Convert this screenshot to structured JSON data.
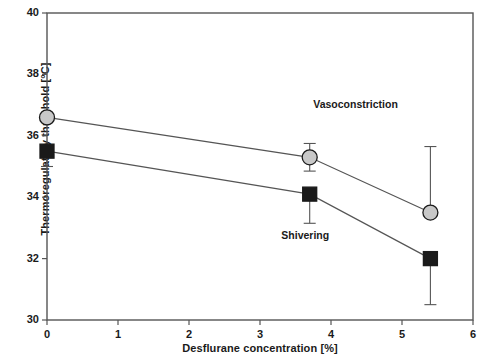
{
  "chart_data": {
    "type": "line",
    "title": "",
    "xlabel": "Desflurane concentration [%]",
    "ylabel": "Thermoregulatory threshold [°C]",
    "xlim": [
      0,
      6
    ],
    "ylim": [
      30,
      40
    ],
    "xticks": [
      "0",
      "1",
      "2",
      "3",
      "4",
      "5",
      "6"
    ],
    "xtick_values": [
      0,
      1,
      2,
      3,
      4,
      5,
      6
    ],
    "yticks": [
      "30",
      "32",
      "34",
      "36",
      "38",
      "40"
    ],
    "ytick_values": [
      30,
      32,
      34,
      36,
      38,
      40
    ],
    "grid": false,
    "legend": "inline-annotations",
    "x": [
      0,
      3.7,
      5.4
    ],
    "series": [
      {
        "name": "Vasoconstriction",
        "marker": "circle",
        "marker_fill": "#c8c8c8",
        "marker_edge": "#1a1a1a",
        "values": [
          36.6,
          35.3,
          33.5
        ],
        "err_low": [
          0,
          0.45,
          0
        ],
        "err_high": [
          0,
          0.45,
          2.15
        ]
      },
      {
        "name": "Shivering",
        "marker": "square",
        "marker_fill": "#1a1a1a",
        "marker_edge": "#1a1a1a",
        "values": [
          35.5,
          34.1,
          32.0
        ],
        "err_low": [
          0.5,
          0.95,
          1.5
        ],
        "err_high": [
          0,
          0,
          0
        ]
      }
    ],
    "annotations": [
      {
        "text": "Vasoconstriction",
        "x": 3.75,
        "y": 37.0
      },
      {
        "text": "Shivering",
        "x": 3.3,
        "y": 32.75
      }
    ]
  },
  "style": {
    "axis_color": "#555555",
    "text_color": "#1a1a1a",
    "background": "#ffffff",
    "line_color": "#555555"
  }
}
